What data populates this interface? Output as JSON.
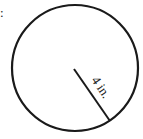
{
  "diagram": {
    "type": "circle-radius",
    "prefix": ":",
    "radius_label": "4 in.",
    "colors": {
      "stroke": "#1a1a1a",
      "background": "#ffffff"
    }
  }
}
